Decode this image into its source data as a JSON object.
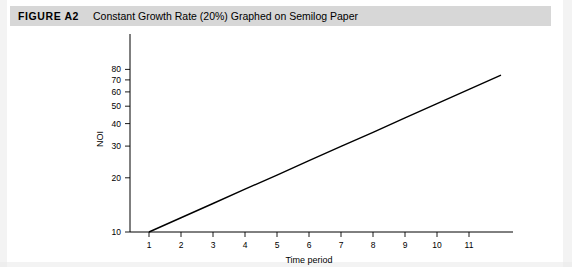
{
  "figure": {
    "label": "FIGURE A2",
    "title": "Constant Growth Rate (20%) Graphed on Semilog Paper"
  },
  "chart_data": {
    "type": "line",
    "title": "Constant Growth Rate (20%) Graphed on Semilog Paper",
    "xlabel": "Time period",
    "ylabel": "NOI",
    "yscale": "log",
    "ylim": [
      10,
      80
    ],
    "xlim": [
      0.4,
      12.3
    ],
    "grid": false,
    "legend": null,
    "yticks": [
      10,
      20,
      30,
      40,
      50,
      60,
      70,
      80
    ],
    "ytick_labels": [
      "10",
      "20",
      "30",
      "40",
      "50",
      "60",
      "70",
      "80"
    ],
    "xticks": [
      1,
      2,
      3,
      4,
      5,
      6,
      7,
      8,
      9,
      10,
      11
    ],
    "xtick_labels": [
      "1",
      "2",
      "3",
      "4",
      "5",
      "6",
      "7",
      "8",
      "9",
      "10",
      "11"
    ],
    "series": [
      {
        "name": "NOI",
        "x": [
          1,
          2,
          3,
          4,
          5,
          6,
          7,
          8,
          9,
          10,
          11,
          12
        ],
        "values": [
          10.0,
          12.0,
          14.4,
          17.3,
          20.7,
          24.9,
          29.9,
          35.8,
          43.0,
          51.6,
          61.9,
          74.3
        ]
      }
    ]
  },
  "colors": {
    "header_bar": "#d7d7d7",
    "line": "#000000",
    "axis": "#000000",
    "page": "#ffffff"
  }
}
